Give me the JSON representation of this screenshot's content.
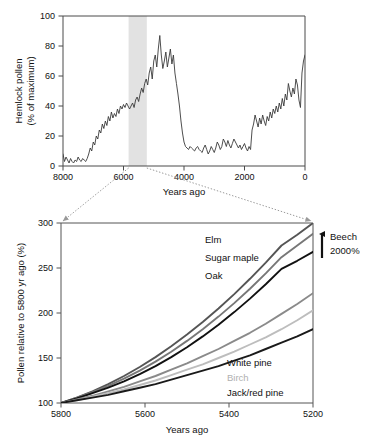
{
  "figure": {
    "name": "hemlock-pollen-decline-figure",
    "background": "#ffffff"
  },
  "chart_data": [
    {
      "id": "top",
      "type": "line",
      "title": "",
      "xlabel": "Years ago",
      "ylabel": "Hemlock pollen\n(% of maximum)",
      "ylabel_line1": "Hemlock pollen",
      "ylabel_line2": "(% of maximum)",
      "xlim": [
        8000,
        0
      ],
      "ylim": [
        0,
        100
      ],
      "xticks": [
        8000,
        6000,
        4000,
        2000,
        0
      ],
      "xticklabels": [
        "8000",
        "6000",
        "4000",
        "2000",
        "0"
      ],
      "yticks": [
        0,
        20,
        40,
        60,
        80,
        100
      ],
      "yticklabels": [
        "0",
        "20",
        "40",
        "60",
        "80",
        "100"
      ],
      "grid": false,
      "legend": "none",
      "x_axis_reversed": true,
      "highlight_band": {
        "name": "hemlock-decline-band",
        "x_start": 5800,
        "x_end": 5200,
        "color": "#e2e2e2"
      },
      "series": [
        {
          "name": "Hemlock pollen",
          "color": "#3a3a3a",
          "x": [
            8000,
            7950,
            7900,
            7850,
            7800,
            7750,
            7700,
            7650,
            7600,
            7550,
            7500,
            7450,
            7400,
            7350,
            7300,
            7250,
            7200,
            7150,
            7100,
            7050,
            7000,
            6950,
            6900,
            6850,
            6800,
            6750,
            6700,
            6650,
            6600,
            6550,
            6500,
            6450,
            6400,
            6350,
            6300,
            6250,
            6200,
            6150,
            6100,
            6050,
            6000,
            5950,
            5900,
            5850,
            5800,
            5750,
            5700,
            5650,
            5600,
            5550,
            5500,
            5450,
            5400,
            5350,
            5300,
            5250,
            5200,
            5150,
            5100,
            5050,
            5000,
            4950,
            4900,
            4850,
            4800,
            4750,
            4700,
            4650,
            4600,
            4550,
            4500,
            4450,
            4400,
            4350,
            4300,
            4250,
            4200,
            4150,
            4100,
            4050,
            4000,
            3950,
            3900,
            3850,
            3800,
            3750,
            3700,
            3650,
            3600,
            3550,
            3500,
            3450,
            3400,
            3350,
            3300,
            3250,
            3200,
            3150,
            3100,
            3050,
            3000,
            2950,
            2900,
            2850,
            2800,
            2750,
            2700,
            2650,
            2600,
            2550,
            2500,
            2450,
            2400,
            2350,
            2300,
            2250,
            2200,
            2150,
            2100,
            2050,
            2000,
            1950,
            1900,
            1850,
            1800,
            1750,
            1700,
            1650,
            1600,
            1550,
            1500,
            1450,
            1400,
            1350,
            1300,
            1250,
            1200,
            1150,
            1100,
            1050,
            1000,
            950,
            900,
            850,
            800,
            750,
            700,
            650,
            600,
            550,
            500,
            450,
            400,
            350,
            300,
            250,
            200,
            150,
            100,
            50,
            0
          ],
          "y": [
            8,
            3,
            6,
            4,
            2,
            5,
            3,
            2,
            4,
            3,
            6,
            4,
            3,
            5,
            4,
            3,
            5,
            8,
            12,
            10,
            16,
            14,
            20,
            18,
            24,
            22,
            28,
            25,
            30,
            27,
            33,
            30,
            36,
            32,
            35,
            33,
            38,
            35,
            40,
            38,
            41,
            39,
            42,
            40,
            38,
            40,
            42,
            39,
            44,
            46,
            43,
            48,
            52,
            49,
            55,
            58,
            54,
            62,
            66,
            58,
            70,
            74,
            66,
            78,
            87,
            74,
            65,
            70,
            76,
            66,
            72,
            78,
            68,
            74,
            62,
            55,
            48,
            40,
            30,
            22,
            16,
            13,
            12,
            11,
            13,
            12,
            11,
            10,
            12,
            13,
            11,
            10,
            9,
            12,
            14,
            11,
            8,
            10,
            13,
            11,
            9,
            12,
            16,
            14,
            11,
            13,
            18,
            16,
            13,
            17,
            14,
            12,
            15,
            18,
            16,
            14,
            12,
            14,
            11,
            13,
            15,
            12,
            10,
            13,
            11,
            24,
            28,
            34,
            30,
            26,
            32,
            28,
            34,
            30,
            27,
            33,
            30,
            36,
            32,
            38,
            35,
            40,
            36,
            42,
            38,
            45,
            40,
            48,
            44,
            55,
            50,
            46,
            52,
            48,
            58,
            54,
            44,
            39,
            62,
            70,
            74,
            72,
            68,
            74,
            70,
            66,
            73,
            70,
            80,
            76,
            72,
            66,
            70,
            76,
            80,
            84,
            88,
            84,
            78,
            82,
            86,
            78,
            70,
            65,
            70,
            66,
            74,
            70,
            80,
            86,
            82,
            76,
            70,
            64,
            58,
            62,
            58,
            54,
            60,
            56,
            62,
            58,
            64,
            60,
            68,
            72,
            76,
            80,
            74,
            70,
            66,
            70,
            74,
            78,
            82,
            88,
            94,
            88,
            82,
            76,
            70,
            64,
            68,
            62,
            58,
            64,
            68,
            72,
            76,
            72,
            66,
            60,
            64,
            70,
            76,
            82,
            88,
            94,
            100,
            92,
            84,
            76,
            70,
            64,
            60,
            66,
            72,
            66,
            60,
            56,
            62,
            68,
            74,
            68,
            62,
            56,
            50,
            44,
            38,
            32,
            26,
            22,
            28,
            24,
            20,
            17,
            15,
            16
          ]
        }
      ]
    },
    {
      "id": "bottom",
      "type": "line",
      "title": "",
      "xlabel": "Years ago",
      "ylabel": "Pollen relative to 5800 yr ago (%)",
      "xlim": [
        5800,
        5200
      ],
      "ylim": [
        100,
        300
      ],
      "xticks": [
        5800,
        5600,
        5400,
        5200
      ],
      "xticklabels": [
        "5800",
        "5600",
        "5400",
        "5200"
      ],
      "yticks": [
        100,
        150,
        200,
        250,
        300
      ],
      "yticklabels": [
        "100",
        "150",
        "200",
        "250",
        "300"
      ],
      "grid": false,
      "legend": "inline-annotations",
      "x_axis_reversed": true,
      "series": [
        {
          "name": "Elm",
          "color": "#555555",
          "end_value": 300,
          "values": [
            100,
            106,
            113,
            121,
            130,
            140,
            151,
            163,
            176,
            190,
            205,
            221,
            238,
            256,
            275,
            287,
            300
          ]
        },
        {
          "name": "Sugar maple",
          "color": "#777777",
          "end_value": 288,
          "values": [
            100,
            106,
            112,
            119,
            127,
            136,
            146,
            157,
            169,
            182,
            196,
            211,
            227,
            244,
            262,
            275,
            288
          ]
        },
        {
          "name": "Oak",
          "color": "#111111",
          "end_value": 268,
          "values": [
            100,
            105,
            111,
            117,
            124,
            132,
            141,
            151,
            162,
            174,
            187,
            201,
            216,
            232,
            249,
            258,
            268
          ]
        },
        {
          "name": "White pine",
          "color": "#8a8a8a",
          "end_value": 222,
          "values": [
            100,
            104,
            108,
            113,
            118,
            124,
            130,
            137,
            144,
            152,
            160,
            169,
            178,
            188,
            199,
            210,
            222
          ]
        },
        {
          "name": "Birch",
          "color": "#bdbdbd",
          "end_value": 203,
          "values": [
            100,
            103,
            107,
            111,
            115,
            120,
            125,
            131,
            137,
            143,
            150,
            157,
            165,
            173,
            182,
            192,
            203
          ]
        },
        {
          "name": "Jack/red pine",
          "color": "#1a1a1a",
          "end_value": 182,
          "values": [
            100,
            103,
            106,
            109,
            113,
            117,
            121,
            126,
            131,
            136,
            141,
            147,
            153,
            160,
            167,
            174,
            182
          ]
        }
      ],
      "annotations": [
        {
          "name": "beech-annotation",
          "line1": "Beech",
          "line2": "2000%",
          "arrow": "up"
        }
      ]
    }
  ],
  "connectors": {
    "name": "zoom-callout-connectors",
    "style": "dotted",
    "color": "#9a9a9a",
    "arrowhead": true
  }
}
